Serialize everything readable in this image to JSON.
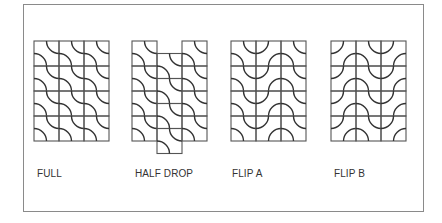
{
  "figure": {
    "stroke_color": "#333333",
    "frame_color": "#8a8a8a",
    "cell_size": 25,
    "tile_types": {
      "A": "quarter-arcs at top-right and bottom-left corners",
      "B": "quarter-arcs at top-left and bottom-right corners (mirror of A)"
    },
    "patterns": [
      {
        "id": "full",
        "label": "FULL",
        "label_x": 37,
        "x": 34,
        "y": 41,
        "cols": 3,
        "rows": 4,
        "col_offsets": [
          0,
          0,
          0
        ],
        "col_tiles": [
          "A",
          "A",
          "A"
        ]
      },
      {
        "id": "half-drop",
        "label": "HALF DROP",
        "label_x": 135,
        "x": 132,
        "y": 41,
        "cols": 3,
        "rows": 4,
        "col_offsets": [
          0,
          12.5,
          0
        ],
        "col_tiles": [
          "A",
          "A",
          "A"
        ]
      },
      {
        "id": "flip-a",
        "label": "FLIP A",
        "label_x": 232,
        "x": 231,
        "y": 41,
        "cols": 3,
        "rows": 4,
        "col_offsets": [
          0,
          0,
          0
        ],
        "col_tiles": [
          "A",
          "B",
          "A"
        ]
      },
      {
        "id": "flip-b",
        "label": "FLIP B",
        "label_x": 334,
        "x": 331,
        "y": 41,
        "cols": 3,
        "rows": 4,
        "col_offsets": [
          0,
          0,
          0
        ],
        "col_tiles": [
          "B",
          "A",
          "B"
        ]
      }
    ]
  }
}
